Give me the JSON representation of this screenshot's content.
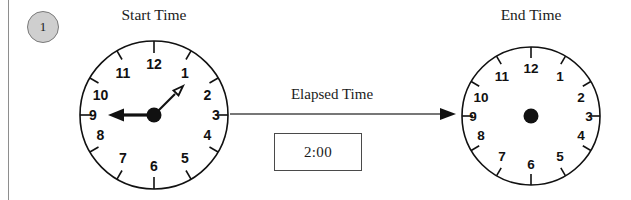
{
  "worksheet": {
    "problem_number": "1",
    "background_color": "#ffffff",
    "ink_color": "#111111",
    "badge_color": "#cfcfcf"
  },
  "start_panel": {
    "heading": "Start Time",
    "clock": {
      "name": "start-time-clock",
      "hour_numerals": [
        "12",
        "1",
        "2",
        "3",
        "4",
        "5",
        "6",
        "7",
        "8",
        "9",
        "10",
        "11"
      ],
      "hour_hand_angle_degrees": 46,
      "minute_hand_angle_degrees": 270,
      "has_hands": true,
      "center_dot": true
    }
  },
  "middle_panel": {
    "label": "Elapsed Time",
    "arrow": "right-arrow",
    "answer_box_value": "2:00"
  },
  "end_panel": {
    "heading": "End Time",
    "clock": {
      "name": "end-time-clock",
      "hour_numerals": [
        "12",
        "1",
        "2",
        "3",
        "4",
        "5",
        "6",
        "7",
        "8",
        "9",
        "10",
        "11"
      ],
      "has_hands": false,
      "center_dot": true
    }
  }
}
